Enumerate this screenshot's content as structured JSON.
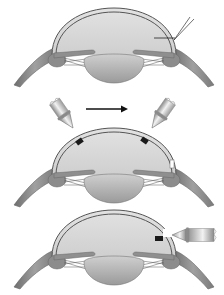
{
  "figure": {
    "type": "surgical-procedure-diagram",
    "style": "grayscale illustration",
    "background": "#ffffff",
    "colors": {
      "chamber_fill": "#d9d9d9",
      "cornea_outline": "#555555",
      "tissue": "#8a8a8a",
      "lens": "#bdbdbd",
      "marker_dark": "#1a1a1a",
      "probe_light": "#e6e6e6",
      "probe_dark": "#7a7a7a",
      "arrow": "#111111"
    },
    "panels": [
      {
        "id": "step-1",
        "caption": "Eye cross-section with corneal incision",
        "elements": [
          "cornea-dome",
          "anterior-chamber",
          "iris",
          "lens",
          "ciliary-body",
          "zonules",
          "sclera",
          "incision-lines"
        ]
      },
      {
        "id": "step-2",
        "caption": "Two probes applied; direction arrow left to right",
        "elements": [
          "probe-left",
          "direction-arrow",
          "probe-right",
          "marker-left",
          "marker-right",
          "limbal-notch"
        ]
      },
      {
        "id": "step-3",
        "caption": "Probe inserted horizontally at corneal opening",
        "elements": [
          "marker-side",
          "probe-horizontal"
        ]
      }
    ]
  },
  "labels": {
    "step1": "Step 1",
    "step2": "Step 2",
    "step3": "Step 3"
  }
}
